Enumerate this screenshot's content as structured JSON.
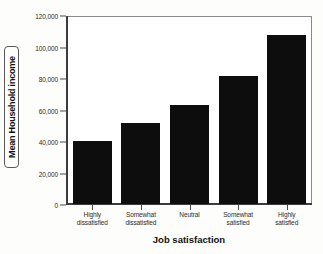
{
  "chart_data": {
    "type": "bar",
    "title": "",
    "subtitle": "",
    "xlabel": "Job satisfaction",
    "ylabel": "Mean Household income",
    "categories": [
      "Highly dissatisfied",
      "Somewhat dissatisfied",
      "Neutral",
      "Somewhat satisfied",
      "Highly satisfied"
    ],
    "category_lines": [
      [
        "Highly",
        "dissatisfied"
      ],
      [
        "Somewhat",
        "dissatisfied"
      ],
      [
        "Neutral",
        ""
      ],
      [
        "Somewhat",
        "satisfied"
      ],
      [
        "Highly",
        "satisfied"
      ]
    ],
    "values": [
      40000,
      51500,
      63000,
      82000,
      108000
    ],
    "ylim": [
      0,
      120000
    ],
    "yticks": [
      0,
      20000,
      40000,
      60000,
      80000,
      100000,
      120000
    ],
    "ytick_labels": [
      "0",
      "20,000",
      "40,000",
      "60,000",
      "80,000",
      "100,000",
      "120,000"
    ],
    "grid": false,
    "legend": "none",
    "bar_color": "#0d0d0d",
    "plot_background": "#ffffff",
    "figure_background": "#fdfdfb",
    "axis_color": "#3c3c3c",
    "frame_color": "#7a7a7a"
  }
}
